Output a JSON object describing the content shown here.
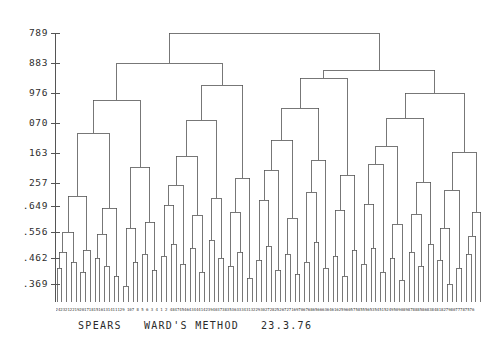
{
  "figure": {
    "caption": "SPEARS   WARD'S METHOD   23.3.76",
    "title": "SPEARS",
    "method": "WARD'S METHOD",
    "date": "23.3.76",
    "line_color": "#555555",
    "background": "#ffffff",
    "text_color": "#2b2b2b"
  },
  "axis": {
    "orientation": "vertical-left",
    "x_position": 55,
    "top": 33,
    "bottom": 302,
    "tick_labels": [
      "789",
      "883",
      "976",
      "070",
      "163",
      "257",
      ".649",
      ".556",
      ".462",
      ".369"
    ],
    "tick_y": [
      33,
      63,
      93,
      123,
      153,
      183,
      206,
      232,
      258,
      284
    ]
  },
  "chart_data": {
    "type": "dendrogram",
    "title": "SPEARS   WARD'S METHOD   23.3.76",
    "xlabel": "",
    "ylabel": "",
    "grid": false,
    "legend": "none",
    "n_leaves": 90,
    "leaf_x_start": 57,
    "leaf_x_step": 4.76,
    "leaf_baseline_y": 302,
    "ylim": [
      302,
      33
    ],
    "tick_values": [
      "789",
      "883",
      "976",
      "070",
      "163",
      "257",
      ".649",
      ".556",
      ".462",
      ".369"
    ],
    "merges": [
      {
        "id": "n0",
        "left": 0,
        "right": 1,
        "y": 268
      },
      {
        "id": "n1",
        "left": "n0",
        "right": 2,
        "y": 252
      },
      {
        "id": "n2",
        "left": 3,
        "right": 4,
        "y": 262
      },
      {
        "id": "n3",
        "left": "n1",
        "right": "n2",
        "y": 232
      },
      {
        "id": "n4",
        "left": 5,
        "right": 6,
        "y": 272
      },
      {
        "id": "n5",
        "left": "n4",
        "right": 7,
        "y": 250
      },
      {
        "id": "n6",
        "left": "n3",
        "right": "n5",
        "y": 196
      },
      {
        "id": "n7",
        "left": 8,
        "right": 9,
        "y": 258
      },
      {
        "id": "n8",
        "left": 10,
        "right": 11,
        "y": 266
      },
      {
        "id": "n9",
        "left": "n7",
        "right": "n8",
        "y": 234
      },
      {
        "id": "n10",
        "left": 12,
        "right": 13,
        "y": 276
      },
      {
        "id": "n11",
        "left": "n9",
        "right": "n10",
        "y": 208
      },
      {
        "id": "n12",
        "left": "n6",
        "right": "n11",
        "y": 133
      },
      {
        "id": "n13",
        "left": 14,
        "right": 15,
        "y": 286
      },
      {
        "id": "n14",
        "left": 16,
        "right": 17,
        "y": 262
      },
      {
        "id": "n15",
        "left": "n13",
        "right": "n14",
        "y": 228
      },
      {
        "id": "n16",
        "left": 18,
        "right": 19,
        "y": 254
      },
      {
        "id": "n17",
        "left": 20,
        "right": 21,
        "y": 270
      },
      {
        "id": "n18",
        "left": "n16",
        "right": "n17",
        "y": 222
      },
      {
        "id": "n19",
        "left": "n15",
        "right": "n18",
        "y": 167
      },
      {
        "id": "n20",
        "left": "n12",
        "right": "n19",
        "y": 100
      },
      {
        "id": "n21",
        "left": 22,
        "right": 23,
        "y": 256
      },
      {
        "id": "n22",
        "left": 24,
        "right": 25,
        "y": 244
      },
      {
        "id": "n23",
        "left": "n21",
        "right": "n22",
        "y": 205
      },
      {
        "id": "n24",
        "left": 26,
        "right": 27,
        "y": 264
      },
      {
        "id": "n25",
        "left": "n23",
        "right": "n24",
        "y": 185
      },
      {
        "id": "n26",
        "left": 28,
        "right": 29,
        "y": 248
      },
      {
        "id": "n27",
        "left": 30,
        "right": 31,
        "y": 272
      },
      {
        "id": "n28",
        "left": "n26",
        "right": "n27",
        "y": 215
      },
      {
        "id": "n29",
        "left": "n25",
        "right": "n28",
        "y": 156
      },
      {
        "id": "n30",
        "left": 32,
        "right": 33,
        "y": 240
      },
      {
        "id": "n31",
        "left": 34,
        "right": 35,
        "y": 258
      },
      {
        "id": "n32",
        "left": "n30",
        "right": "n31",
        "y": 198
      },
      {
        "id": "n33",
        "left": "n29",
        "right": "n32",
        "y": 120
      },
      {
        "id": "n34",
        "left": 36,
        "right": 37,
        "y": 266
      },
      {
        "id": "n35",
        "left": 38,
        "right": 39,
        "y": 252
      },
      {
        "id": "n36",
        "left": "n34",
        "right": "n35",
        "y": 212
      },
      {
        "id": "n37",
        "left": 40,
        "right": 41,
        "y": 278
      },
      {
        "id": "n38",
        "left": "n36",
        "right": "n37",
        "y": 178
      },
      {
        "id": "n39",
        "left": "n33",
        "right": "n38",
        "y": 85
      },
      {
        "id": "n40",
        "left": "n20",
        "right": "n39",
        "y": 63
      },
      {
        "id": "n41",
        "left": 42,
        "right": 43,
        "y": 260
      },
      {
        "id": "n42",
        "left": 44,
        "right": 45,
        "y": 246
      },
      {
        "id": "n43",
        "left": "n41",
        "right": "n42",
        "y": 200
      },
      {
        "id": "n44",
        "left": 46,
        "right": 47,
        "y": 270
      },
      {
        "id": "n45",
        "left": "n43",
        "right": "n44",
        "y": 170
      },
      {
        "id": "n46",
        "left": 48,
        "right": 49,
        "y": 254
      },
      {
        "id": "n47",
        "left": 50,
        "right": 51,
        "y": 274
      },
      {
        "id": "n48",
        "left": "n46",
        "right": "n47",
        "y": 218
      },
      {
        "id": "n49",
        "left": "n45",
        "right": "n48",
        "y": 140
      },
      {
        "id": "n50",
        "left": 52,
        "right": 53,
        "y": 262
      },
      {
        "id": "n51",
        "left": 54,
        "right": 55,
        "y": 242
      },
      {
        "id": "n52",
        "left": "n50",
        "right": "n51",
        "y": 192
      },
      {
        "id": "n53",
        "left": 56,
        "right": 57,
        "y": 268
      },
      {
        "id": "n54",
        "left": "n52",
        "right": "n53",
        "y": 160
      },
      {
        "id": "n55",
        "left": "n49",
        "right": "n54",
        "y": 108
      },
      {
        "id": "n56",
        "left": 58,
        "right": 59,
        "y": 256
      },
      {
        "id": "n57",
        "left": 60,
        "right": 61,
        "y": 276
      },
      {
        "id": "n58",
        "left": "n56",
        "right": "n57",
        "y": 210
      },
      {
        "id": "n59",
        "left": 62,
        "right": 63,
        "y": 250
      },
      {
        "id": "n60",
        "left": "n58",
        "right": "n59",
        "y": 175
      },
      {
        "id": "n61",
        "left": "n55",
        "right": "n60",
        "y": 78
      },
      {
        "id": "n62",
        "left": 64,
        "right": 65,
        "y": 264
      },
      {
        "id": "n63",
        "left": 66,
        "right": 67,
        "y": 248
      },
      {
        "id": "n64",
        "left": "n62",
        "right": "n63",
        "y": 204
      },
      {
        "id": "n65",
        "left": 68,
        "right": 69,
        "y": 272
      },
      {
        "id": "n66",
        "left": "n64",
        "right": "n65",
        "y": 164
      },
      {
        "id": "n67",
        "left": 70,
        "right": 71,
        "y": 258
      },
      {
        "id": "n68",
        "left": 72,
        "right": 73,
        "y": 280
      },
      {
        "id": "n69",
        "left": "n67",
        "right": "n68",
        "y": 224
      },
      {
        "id": "n70",
        "left": "n66",
        "right": "n69",
        "y": 146
      },
      {
        "id": "n71",
        "left": 74,
        "right": 75,
        "y": 252
      },
      {
        "id": "n72",
        "left": 76,
        "right": 77,
        "y": 266
      },
      {
        "id": "n73",
        "left": "n71",
        "right": "n72",
        "y": 214
      },
      {
        "id": "n74",
        "left": 78,
        "right": 79,
        "y": 244
      },
      {
        "id": "n75",
        "left": "n73",
        "right": "n74",
        "y": 182
      },
      {
        "id": "n76",
        "left": "n70",
        "right": "n75",
        "y": 118
      },
      {
        "id": "n77",
        "left": 80,
        "right": 81,
        "y": 260
      },
      {
        "id": "n78",
        "left": 82,
        "right": 83,
        "y": 284
      },
      {
        "id": "n79",
        "left": "n77",
        "right": "n78",
        "y": 228
      },
      {
        "id": "n80",
        "left": 84,
        "right": 85,
        "y": 268
      },
      {
        "id": "n81",
        "left": "n79",
        "right": "n80",
        "y": 190
      },
      {
        "id": "n82",
        "left": 86,
        "right": 87,
        "y": 254
      },
      {
        "id": "n83",
        "left": "n82",
        "right": 88,
        "y": 236
      },
      {
        "id": "n84",
        "left": "n83",
        "right": 89,
        "y": 212
      },
      {
        "id": "n85",
        "left": "n81",
        "right": "n84",
        "y": 152
      },
      {
        "id": "n86",
        "left": "n76",
        "right": "n85",
        "y": 93
      },
      {
        "id": "n87",
        "left": "n61",
        "right": "n86",
        "y": 70
      },
      {
        "id": "n88",
        "left": "n40",
        "right": "n87",
        "y": 33
      }
    ],
    "leaf_labels": [
      "24",
      "23",
      "21",
      "22",
      "19",
      "20",
      "17",
      "18",
      "15",
      "16",
      "13",
      "14",
      "11",
      "12",
      "9",
      "10",
      "7",
      "8",
      "5",
      "6",
      "3",
      "4",
      "1",
      "2",
      "48",
      "47",
      "45",
      "46",
      "43",
      "44",
      "41",
      "42",
      "39",
      "40",
      "37",
      "38",
      "35",
      "36",
      "33",
      "34",
      "31",
      "32",
      "29",
      "30",
      "27",
      "28",
      "25",
      "26",
      "72",
      "71",
      "69",
      "70",
      "67",
      "68",
      "65",
      "66",
      "63",
      "64",
      "61",
      "62",
      "59",
      "60",
      "57",
      "58",
      "55",
      "56",
      "53",
      "54",
      "51",
      "52",
      "49",
      "50",
      "90",
      "89",
      "87",
      "88",
      "85",
      "86",
      "83",
      "84",
      "81",
      "82",
      "79",
      "80",
      "77",
      "78",
      "75",
      "76"
    ]
  }
}
